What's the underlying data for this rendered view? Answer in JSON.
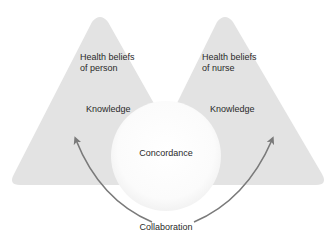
{
  "diagram": {
    "left_triangle": {
      "title": "Health beliefs\nof person",
      "subtitle": "Knowledge"
    },
    "right_triangle": {
      "title": "Health beliefs\nof nurse",
      "subtitle": "Knowledge"
    },
    "center_circle": {
      "label": "Concordance"
    },
    "bottom_label": "Collaboration",
    "colors": {
      "triangle_fill": "#e3e3e3",
      "circle_fill": "#fbfbfb",
      "arrow": "#7a7a7a",
      "text": "#2a2a2a"
    }
  }
}
